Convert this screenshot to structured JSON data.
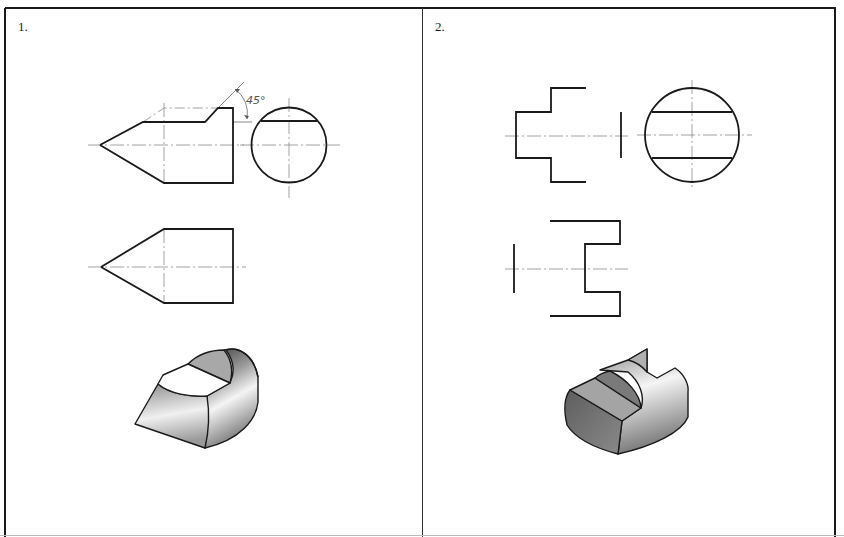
{
  "panels": [
    {
      "number": "1.",
      "annotation": "45°",
      "views": [
        "front-view",
        "top-view",
        "side-view",
        "isometric-view"
      ]
    },
    {
      "number": "2.",
      "views": [
        "front-view",
        "top-view",
        "side-view",
        "isometric-view"
      ]
    }
  ],
  "colors": {
    "frame": "#1a1a1a",
    "outline": "#1a1a1a",
    "centerline": "#8a8a8a",
    "shade_dark": "#6e6e6e",
    "shade_mid": "#a8a8a8",
    "shade_light": "#f2f2f2"
  }
}
